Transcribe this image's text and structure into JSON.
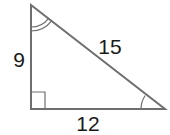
{
  "diagram": {
    "type": "right-triangle",
    "colors": {
      "stroke": "#6e6e6e",
      "text": "#1a1a1a",
      "background": "#ffffff"
    },
    "vertices": {
      "top": [
        31,
        5
      ],
      "right_angle": [
        31,
        109
      ],
      "bottom_right": [
        165,
        109
      ]
    },
    "sides": {
      "vertical": {
        "label": "9"
      },
      "horizontal": {
        "label": "12"
      },
      "hypotenuse": {
        "label": "15"
      }
    },
    "markers": {
      "right_angle": "square at bottom-left vertex",
      "top_angle": "double arc",
      "bottom_right_angle": "single arc"
    }
  }
}
